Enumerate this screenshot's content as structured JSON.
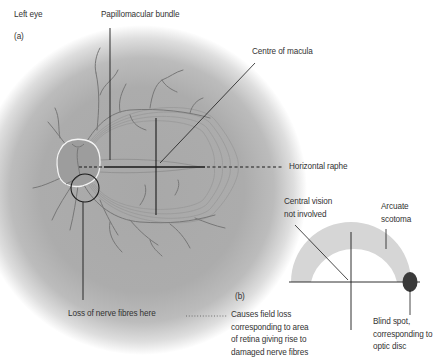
{
  "figure": {
    "eye_side_label": "Left eye",
    "panel_a_label": "(a)",
    "panel_b_label": "(b)"
  },
  "panel_a": {
    "labels": {
      "papillomacular_bundle": "Papillomacular bundle",
      "centre_of_macula": "Centre of macula",
      "horizontal_raphe": "Horizontal raphe",
      "loss_of_nerve_fibres": "Loss of nerve fibres here"
    },
    "colors": {
      "fundus_center": "#a9a9a9",
      "fundus_edge": "#ffffff",
      "vessels": "#7a7a7a",
      "optic_disc_outline": "#f2f2f2",
      "lesion_circle": "#1a1a1a"
    }
  },
  "panel_b": {
    "labels": {
      "central_vision_line1": "Central vision",
      "central_vision_line2": "not involved",
      "arcuate_scotoma_line1": "Arcuate",
      "arcuate_scotoma_line2": "scotoma",
      "blind_spot_line1": "Blind spot,",
      "blind_spot_line2": "corresponding to",
      "blind_spot_line3": "optic disc"
    },
    "caption_lines": [
      "Causes field loss",
      "corresponding to area",
      "of retina giving rise to",
      "damaged nerve fibres"
    ],
    "colors": {
      "scotoma": "#d6d6d6",
      "blind_spot": "#3a3a3a",
      "axes": "#1a1a1a"
    }
  }
}
